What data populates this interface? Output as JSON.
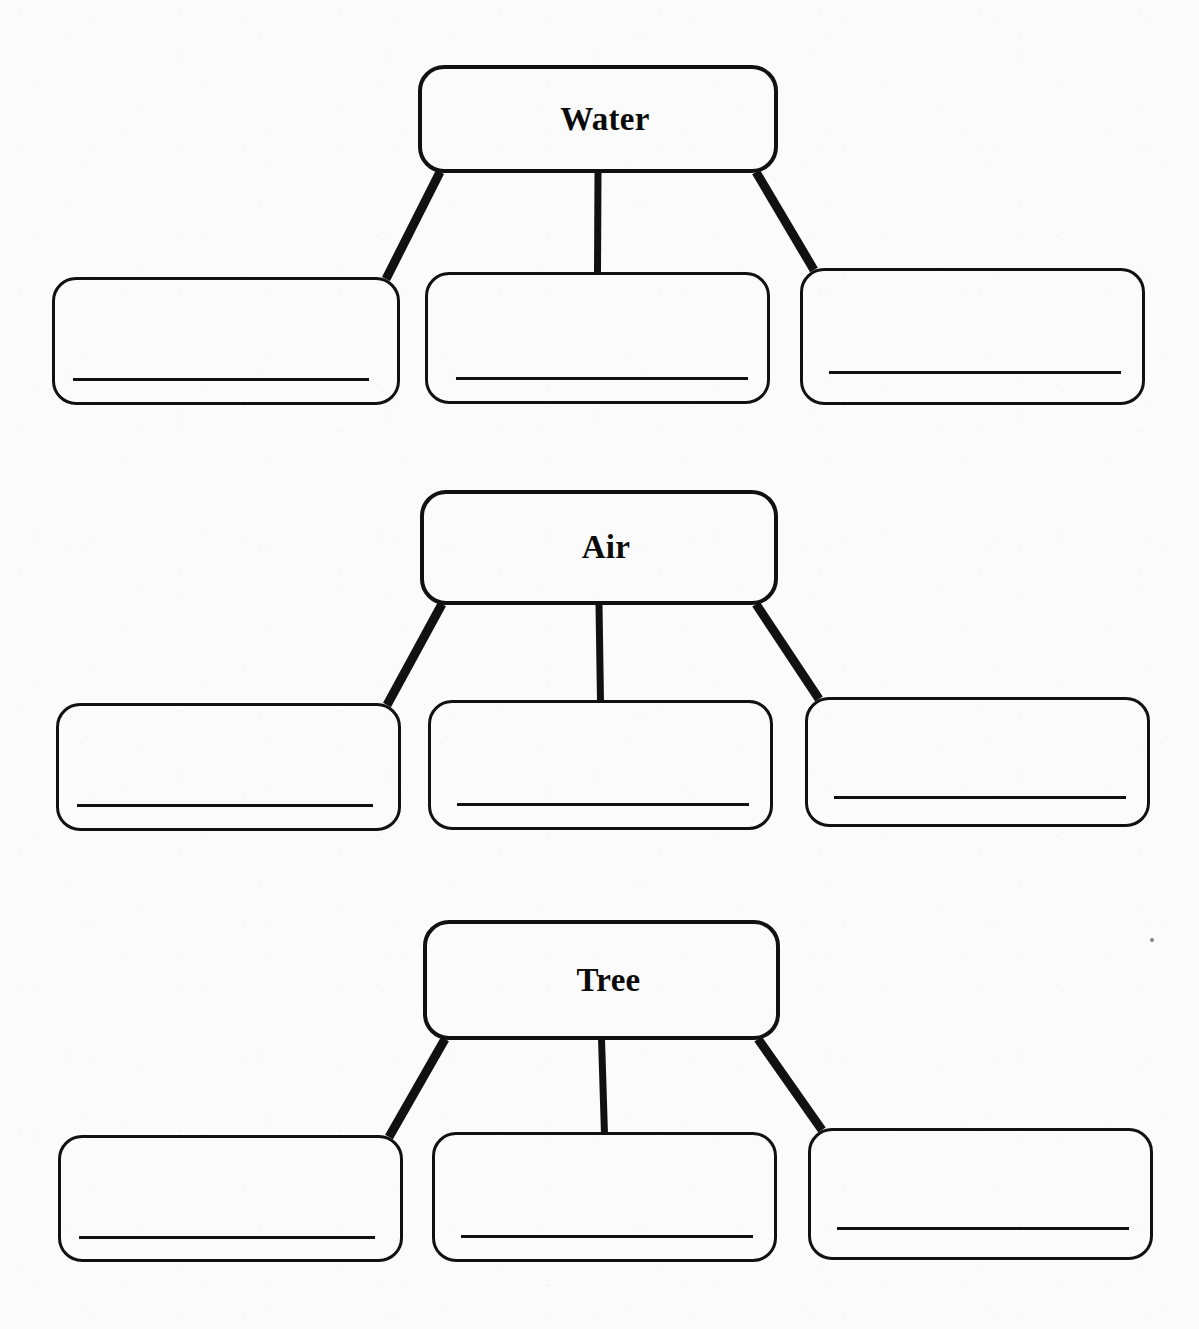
{
  "worksheet": {
    "type": "concept-map-worksheet",
    "background_color": "#fbfbfb",
    "ink_color": "#111111",
    "width": 1199,
    "height": 1329,
    "groups": [
      {
        "id": "water",
        "parent_label": "Water",
        "parent_box": {
          "x": 418,
          "y": 65,
          "width": 360,
          "height": 108
        },
        "children": [
          {
            "id": "water-child-1",
            "label": "",
            "box": {
              "x": 52,
              "y": 277,
              "width": 348,
              "height": 128
            },
            "line": {
              "x": 18,
              "y": 98,
              "width": 296
            }
          },
          {
            "id": "water-child-2",
            "label": "",
            "box": {
              "x": 425,
              "y": 272,
              "width": 345,
              "height": 132
            },
            "line": {
              "x": 28,
              "y": 102,
              "width": 292
            }
          },
          {
            "id": "water-child-3",
            "label": "",
            "box": {
              "x": 800,
              "y": 268,
              "width": 345,
              "height": 137
            },
            "line": {
              "x": 26,
              "y": 100,
              "width": 292
            }
          }
        ]
      },
      {
        "id": "air",
        "parent_label": "Air",
        "parent_box": {
          "x": 420,
          "y": 490,
          "width": 358,
          "height": 115
        },
        "children": [
          {
            "id": "air-child-1",
            "label": "",
            "box": {
              "x": 56,
              "y": 703,
              "width": 345,
              "height": 128
            },
            "line": {
              "x": 18,
              "y": 98,
              "width": 296
            }
          },
          {
            "id": "air-child-2",
            "label": "",
            "box": {
              "x": 428,
              "y": 700,
              "width": 345,
              "height": 130
            },
            "line": {
              "x": 26,
              "y": 100,
              "width": 292
            }
          },
          {
            "id": "air-child-3",
            "label": "",
            "box": {
              "x": 805,
              "y": 697,
              "width": 345,
              "height": 130
            },
            "line": {
              "x": 26,
              "y": 96,
              "width": 292
            }
          }
        ]
      },
      {
        "id": "tree",
        "parent_label": "Tree",
        "parent_box": {
          "x": 423,
          "y": 920,
          "width": 357,
          "height": 120
        },
        "children": [
          {
            "id": "tree-child-1",
            "label": "",
            "box": {
              "x": 58,
              "y": 1135,
              "width": 345,
              "height": 127
            },
            "line": {
              "x": 18,
              "y": 98,
              "width": 296
            }
          },
          {
            "id": "tree-child-2",
            "label": "",
            "box": {
              "x": 432,
              "y": 1132,
              "width": 345,
              "height": 130
            },
            "line": {
              "x": 26,
              "y": 100,
              "width": 292
            }
          },
          {
            "id": "tree-child-3",
            "label": "",
            "box": {
              "x": 808,
              "y": 1128,
              "width": 345,
              "height": 132
            },
            "line": {
              "x": 26,
              "y": 96,
              "width": 292
            }
          }
        ],
        "stray_mark": {
          "x": 1150,
          "y": 938
        }
      }
    ],
    "connector_style": {
      "stroke_width_diagonal": 9,
      "stroke_width_vertical": 7
    }
  }
}
